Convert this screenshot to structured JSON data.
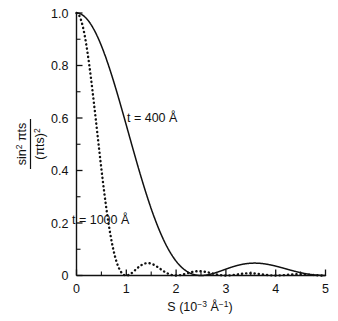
{
  "figure": {
    "background": "#ffffff",
    "ink": "#111111"
  },
  "axes": {
    "x_title_main": "S (10",
    "x_title_exp1": "−3",
    "x_title_mid": " Å",
    "x_title_exp2": "−1",
    "x_title_close": ")",
    "y_title_num_base": "sin",
    "y_title_num_sup": "2",
    "y_title_num_tail": " πts",
    "y_title_den_base": "(πts)",
    "y_title_den_sup": "2",
    "x_ticks": [
      "0",
      "1",
      "2",
      "3",
      "4",
      "5"
    ],
    "y_ticks": [
      "0",
      "0.2",
      "0.4",
      "0.6",
      "0.8",
      "1.0"
    ]
  },
  "annotations": {
    "solid_label": "t = 400 Å",
    "dotted_label": "t = 1000 Å"
  },
  "chart_data": {
    "type": "line",
    "title": "",
    "xlabel": "S (10−3 Å−1)",
    "ylabel": "sin² πts / (πts)²",
    "xlim": [
      0,
      5
    ],
    "ylim": [
      0,
      1.0
    ],
    "xticks": [
      0,
      1,
      2,
      3,
      4,
      5
    ],
    "xticks_minor_step": 0.5,
    "yticks": [
      0,
      0.2,
      0.4,
      0.6,
      0.8,
      1.0
    ],
    "yticks_minor_step": 0.1,
    "grid": false,
    "legend": "inline-annotations",
    "formula": "sin(pi*t*s)^2 / (pi*t*s)^2",
    "series": [
      {
        "name": "t = 400 Å",
        "style": "solid",
        "color": "#111111",
        "t_angstrom": 400,
        "s_scale_inv_angstrom": 0.001,
        "zeros_at_S": [
          2.5,
          5.0
        ],
        "first_sidelobe_S": 3.6,
        "first_sidelobe_value": 0.047,
        "x": [
          0,
          0.25,
          0.5,
          0.75,
          1.0,
          1.25,
          1.5,
          1.75,
          2.0,
          2.25,
          2.5,
          2.75,
          3.0,
          3.25,
          3.5,
          3.75,
          4.0,
          4.25,
          4.5,
          4.75,
          5.0
        ],
        "y": [
          1.0,
          0.974,
          0.9,
          0.79,
          0.656,
          0.514,
          0.375,
          0.25,
          0.147,
          0.068,
          0.0,
          0.009,
          0.026,
          0.04,
          0.047,
          0.046,
          0.037,
          0.024,
          0.011,
          0.003,
          0.0
        ]
      },
      {
        "name": "t = 1000 Å",
        "style": "dotted",
        "color": "#111111",
        "t_angstrom": 1000,
        "s_scale_inv_angstrom": 0.001,
        "zeros_at_S": [
          1.0,
          2.0,
          3.0,
          4.0,
          5.0
        ],
        "first_sidelobe_S": 1.43,
        "first_sidelobe_value": 0.047,
        "x": [
          0,
          0.1,
          0.2,
          0.3,
          0.4,
          0.5,
          0.6,
          0.7,
          0.8,
          0.9,
          1.0,
          1.2,
          1.43,
          1.6,
          1.8,
          2.0,
          2.2,
          2.45,
          2.7,
          3.0,
          3.3,
          3.47,
          3.7,
          4.0,
          4.3,
          4.48,
          4.7,
          5.0
        ],
        "y": [
          1.0,
          0.984,
          0.935,
          0.858,
          0.757,
          0.405,
          0.255,
          0.135,
          0.055,
          0.012,
          0.0,
          0.025,
          0.047,
          0.036,
          0.01,
          0.0,
          0.008,
          0.017,
          0.009,
          0.0,
          0.006,
          0.008,
          0.005,
          0.0,
          0.004,
          0.005,
          0.003,
          0.0
        ]
      }
    ]
  }
}
